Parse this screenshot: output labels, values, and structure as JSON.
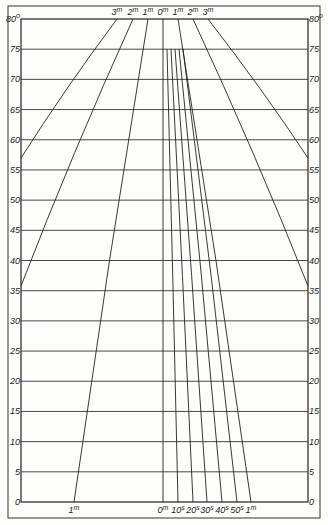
{
  "diagram": {
    "type": "nomogram",
    "frame": {
      "outer": [
        8,
        6,
        320,
        518
      ],
      "inner": [
        21,
        19,
        308,
        502
      ]
    },
    "y_axis": {
      "min": 0,
      "max": 80,
      "step": 5,
      "unit": "°",
      "ticks": [
        "0",
        "5",
        "10",
        "15",
        "20",
        "25",
        "30",
        "35",
        "40",
        "45",
        "50",
        "55",
        "60",
        "65",
        "70",
        "75",
        "80"
      ],
      "top_label_left": "80",
      "top_label_right": "80",
      "degree_mark": "o"
    },
    "top_labels": [
      {
        "text": "3",
        "sup": "m",
        "x": 117
      },
      {
        "text": "2",
        "sup": "m",
        "x": 133
      },
      {
        "text": "1",
        "sup": "m",
        "x": 148
      },
      {
        "text": "0",
        "sup": "m",
        "x": 163
      },
      {
        "text": "1",
        "sup": "m",
        "x": 178
      },
      {
        "text": "2",
        "sup": "m",
        "x": 193
      },
      {
        "text": "3",
        "sup": "m",
        "x": 208
      }
    ],
    "bottom_labels": [
      {
        "text": "1",
        "sup": "m",
        "x": 74
      },
      {
        "text": "0",
        "sup": "m",
        "x": 163
      },
      {
        "text": "10",
        "sup": "s",
        "x": 178
      },
      {
        "text": "20",
        "sup": "s",
        "x": 193
      },
      {
        "text": "30",
        "sup": "s",
        "x": 207
      },
      {
        "text": "40",
        "sup": "s",
        "x": 222
      },
      {
        "text": "50",
        "sup": "s",
        "x": 237
      },
      {
        "text": "1",
        "sup": "m",
        "x": 251
      }
    ],
    "curves": [
      {
        "name": "left-3m",
        "from": [
          117,
          19
        ],
        "to": [
          21,
          158
        ]
      },
      {
        "name": "left-2m",
        "from": [
          133,
          19
        ],
        "to": [
          21,
          286
        ]
      },
      {
        "name": "left-1m",
        "from": [
          148,
          19
        ],
        "to": [
          74,
          502
        ]
      },
      {
        "name": "center-0m",
        "from": [
          163,
          19
        ],
        "to": [
          163,
          502
        ]
      },
      {
        "name": "right-10s",
        "from": [
          167,
          49
        ],
        "to": [
          178,
          502
        ]
      },
      {
        "name": "right-20s",
        "from": [
          171,
          49
        ],
        "to": [
          193,
          502
        ]
      },
      {
        "name": "right-30s",
        "from": [
          175,
          49
        ],
        "to": [
          207,
          502
        ]
      },
      {
        "name": "right-40s",
        "from": [
          179,
          49
        ],
        "to": [
          222,
          502
        ]
      },
      {
        "name": "right-50s",
        "from": [
          183,
          49
        ],
        "to": [
          237,
          502
        ]
      },
      {
        "name": "right-1m",
        "from": [
          178,
          19
        ],
        "to": [
          251,
          502
        ]
      },
      {
        "name": "right-2m",
        "from": [
          193,
          19
        ],
        "to": [
          308,
          286
        ]
      },
      {
        "name": "right-3m",
        "from": [
          208,
          19
        ],
        "to": [
          308,
          158
        ]
      }
    ],
    "colors": {
      "ink": "#222222",
      "paper": "#fdfdfb"
    }
  }
}
